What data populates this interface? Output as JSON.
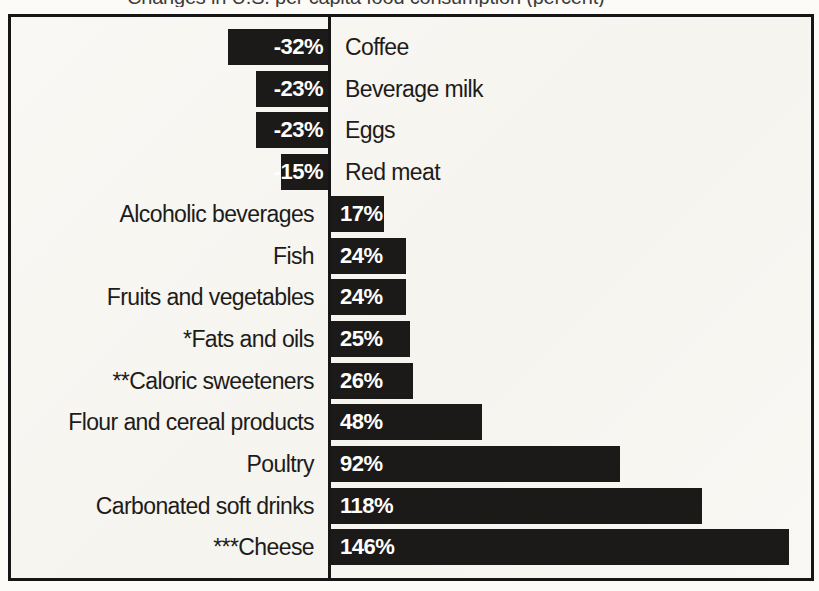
{
  "chart_data": {
    "type": "bar",
    "orientation": "horizontal",
    "title": "Changes in U.S. per capita food consumption (percent)",
    "title_visibility": "clipped at top edge of screenshot",
    "categories": [
      "Coffee",
      "Beverage milk",
      "Eggs",
      "Red meat",
      "Alcoholic beverages",
      "Fish",
      "Fruits and vegetables",
      "*Fats and oils",
      "**Caloric sweeteners",
      "Flour and cereal products",
      "Poultry",
      "Carbonated soft drinks",
      "***Cheese"
    ],
    "values": [
      -32,
      -23,
      -23,
      -15,
      17,
      24,
      24,
      25,
      26,
      48,
      92,
      118,
      146
    ],
    "value_labels": [
      "-32%",
      "-23%",
      "-23%",
      "-15%",
      "17%",
      "24%",
      "24%",
      "25%",
      "26%",
      "48%",
      "92%",
      "118%",
      "146%"
    ],
    "xlabel": "",
    "ylabel": "",
    "xlim": [
      -101,
      154
    ],
    "grid": false,
    "legend": "none",
    "zero_baseline": "vertical line at 0",
    "bar_color": "#1b1a18",
    "value_label_color": "#ffffff",
    "category_label_color": "#1d1c1a",
    "frame_border_color": "#161616",
    "plot_background": "#f8f7f2"
  },
  "layout_constants": {
    "axis_inner_x": 317,
    "axis_line_width": 3,
    "px_per_percent": 3.14,
    "row_pitch": 41.7,
    "first_row_top": 12,
    "bar_height": 36
  }
}
